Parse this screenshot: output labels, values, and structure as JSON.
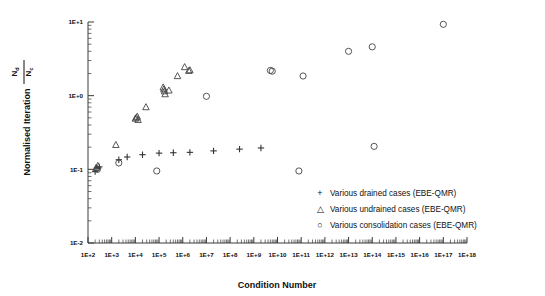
{
  "figure": {
    "title": "",
    "background": "#ffffff",
    "marker_color": "#444444"
  },
  "axis": {
    "x_title": "Condition Number",
    "y_title_main": "Normalised Iteration",
    "y_title_numerator": "N",
    "y_title_numerator_sub": "c",
    "y_title_denominator": "N",
    "y_title_denominator_sub": "d"
  },
  "chart_data": {
    "type": "scatter",
    "title": "",
    "xlabel": "Condition Number",
    "ylabel": "Normalised Iteration Nc/Nd",
    "xscale": "log",
    "yscale": "log",
    "xlim": [
      100,
      1e+18
    ],
    "ylim": [
      0.01,
      10
    ],
    "grid": false,
    "legend_position": "lower-right",
    "x_tick_labels": [
      "1E+2",
      "1E+3",
      "1E+4",
      "1E+5",
      "1E+6",
      "1E+7",
      "1E+8",
      "1E+9",
      "1E+10",
      "1E+11",
      "1E+12",
      "1E+13",
      "1E+14",
      "1E+15",
      "1E+16",
      "1E+17",
      "1E+18"
    ],
    "y_tick_labels": [
      "1E+1",
      "1E+0",
      "1E-1",
      "1E-2"
    ],
    "y_tick_values": [
      10,
      1,
      0.1,
      0.01
    ],
    "series": [
      {
        "name": "Various drained cases (EBE-QMR)",
        "marker": "plus",
        "glyph": "+",
        "points": [
          {
            "x": 200.0,
            "y": 0.093
          },
          {
            "x": 240.0,
            "y": 0.105
          },
          {
            "x": 300.0,
            "y": 0.108
          },
          {
            "x": 2000.0,
            "y": 0.135
          },
          {
            "x": 4500.0,
            "y": 0.147
          },
          {
            "x": 20000.0,
            "y": 0.158
          },
          {
            "x": 100000.0,
            "y": 0.166
          },
          {
            "x": 400000.0,
            "y": 0.168
          },
          {
            "x": 2000000.0,
            "y": 0.17
          },
          {
            "x": 20000000.0,
            "y": 0.178
          },
          {
            "x": 250000000.0,
            "y": 0.188
          },
          {
            "x": 2000000000.0,
            "y": 0.195
          }
        ]
      },
      {
        "name": "Various undrained cases (EBE-QMR)",
        "marker": "triangle",
        "glyph": "△",
        "points": [
          {
            "x": 220.0,
            "y": 0.105
          },
          {
            "x": 260.0,
            "y": 0.112
          },
          {
            "x": 1500.0,
            "y": 0.215
          },
          {
            "x": 10000.0,
            "y": 0.49
          },
          {
            "x": 11000.0,
            "y": 0.505
          },
          {
            "x": 12000.0,
            "y": 0.52
          },
          {
            "x": 13000.0,
            "y": 0.47
          },
          {
            "x": 28000.0,
            "y": 0.7
          },
          {
            "x": 150000.0,
            "y": 1.3
          },
          {
            "x": 160000.0,
            "y": 1.22
          },
          {
            "x": 170000.0,
            "y": 1.15
          },
          {
            "x": 180000.0,
            "y": 1.05
          },
          {
            "x": 260000.0,
            "y": 1.18
          },
          {
            "x": 600000.0,
            "y": 1.85
          },
          {
            "x": 1200000.0,
            "y": 2.45
          },
          {
            "x": 1800000.0,
            "y": 2.18
          },
          {
            "x": 2000000.0,
            "y": 2.22
          }
        ]
      },
      {
        "name": "Various consolidation cases (EBE-QMR)",
        "marker": "circle",
        "glyph": "○",
        "points": [
          {
            "x": 250.0,
            "y": 0.1
          },
          {
            "x": 2000.0,
            "y": 0.122
          },
          {
            "x": 80000.0,
            "y": 0.095
          },
          {
            "x": 10000000.0,
            "y": 0.98
          },
          {
            "x": 5000000000.0,
            "y": 2.2
          },
          {
            "x": 6000000000.0,
            "y": 2.15
          },
          {
            "x": 80000000000.0,
            "y": 0.095
          },
          {
            "x": 120000000000.0,
            "y": 1.85
          },
          {
            "x": 10000000000000.0,
            "y": 4.0
          },
          {
            "x": 100000000000000.0,
            "y": 4.6
          },
          {
            "x": 120000000000000.0,
            "y": 0.205
          },
          {
            "x": 1e+17,
            "y": 9.3
          }
        ]
      }
    ]
  },
  "legend": {
    "entries": [
      {
        "glyph": "+",
        "label": "Various drained cases (EBE-QMR)"
      },
      {
        "glyph": "△",
        "label": "Various undrained cases (EBE-QMR)"
      },
      {
        "glyph": "○",
        "label": "Various consolidation cases (EBE-QMR)"
      }
    ]
  }
}
